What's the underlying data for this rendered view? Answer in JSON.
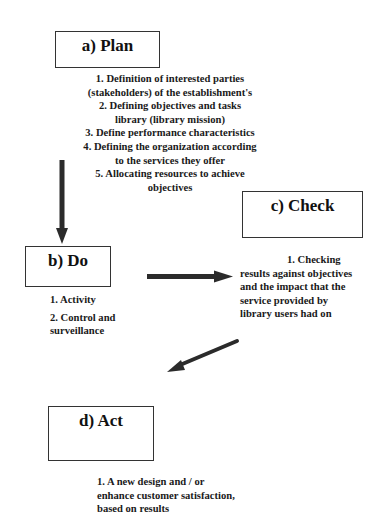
{
  "diagram": {
    "type": "PDCA cycle",
    "plan": {
      "title": "a) Plan",
      "lines": [
        "1. Definition of interested parties",
        "(stakeholders) of the establishment's",
        "2. Defining objectives and tasks",
        "library (library mission)",
        "3. Define performance characteristics",
        "4. Defining the organization according",
        "to the services they offer",
        "5. Allocating resources to achieve",
        "objectives"
      ]
    },
    "do": {
      "title": "b) Do",
      "lines": [
        "1. Activity",
        "2. Control and",
        "surveillance"
      ]
    },
    "check": {
      "title": "c) Check",
      "lines": [
        "1. Checking",
        "results against objectives",
        "and the impact that the",
        "service provided by",
        "library users had on"
      ]
    },
    "act": {
      "title": "d) Act",
      "lines": [
        "1. A new design and / or",
        "enhance customer satisfaction,",
        "based on results"
      ]
    },
    "arrows": [
      {
        "from": "plan",
        "to": "do",
        "direction": "down"
      },
      {
        "from": "do",
        "to": "check",
        "direction": "right"
      },
      {
        "from": "check",
        "to": "act",
        "direction": "down-left"
      }
    ],
    "colors": {
      "arrow": "#2b2b2b",
      "box_border": "#333333",
      "text": "#1a1a1a"
    }
  }
}
